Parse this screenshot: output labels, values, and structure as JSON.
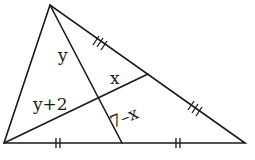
{
  "diagram": {
    "type": "triangle-with-cevians",
    "vertices": {
      "apex": [
        50,
        5
      ],
      "bottom_left": [
        4,
        143
      ],
      "bottom_right": [
        245,
        143
      ]
    },
    "cevian_feet": {
      "on_base": [
        122,
        143
      ],
      "on_right_side": [
        148,
        74
      ]
    },
    "labels": {
      "top_region": "y",
      "left_region": "y+2",
      "upper_right_segment": "x",
      "lower_right_segment": "7–x"
    },
    "tick_marks": {
      "right_side_upper": "triple",
      "right_side_lower": "triple",
      "base_left": "double",
      "base_right": "double"
    }
  }
}
